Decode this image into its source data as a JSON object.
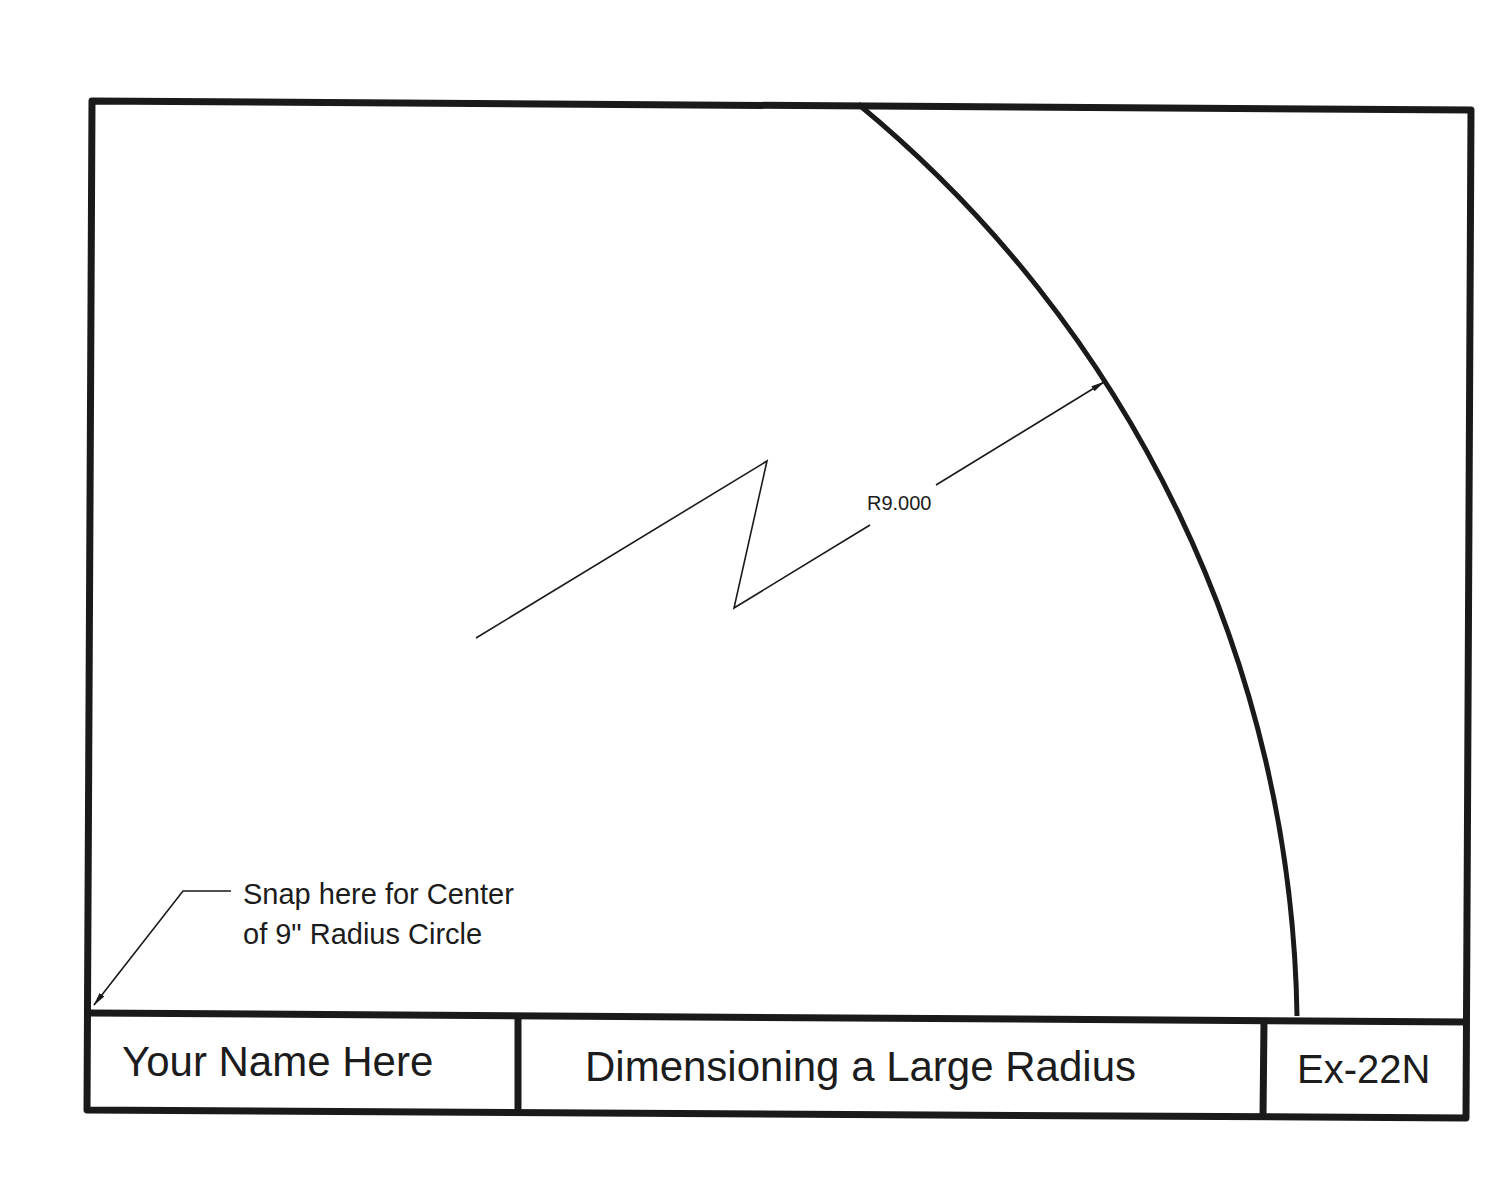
{
  "drawing": {
    "dimension": {
      "label": "R9.000",
      "type": "jogged-radius"
    },
    "note": {
      "line1": "Snap here for Center",
      "line2": "of 9\" Radius Circle"
    },
    "title_block": {
      "name": "Your Name Here",
      "title": "Dimensioning a Large Radius",
      "exercise": "Ex-22N"
    },
    "colors": {
      "line": "#1a1a1a",
      "background": "#ffffff"
    }
  }
}
